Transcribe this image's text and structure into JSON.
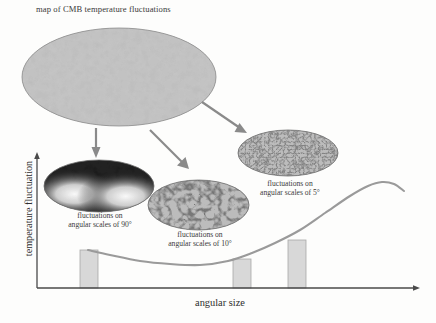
{
  "figure": {
    "title": "map of CMB temperature fluctuations",
    "background_color": "#fdfdfc"
  },
  "axes": {
    "y_label": "temperature fluctuation",
    "x_label": "angular size",
    "axis_color": "#4a4a4a",
    "origin": {
      "x": 37,
      "y": 288
    },
    "x_end": 420,
    "y_top": 152
  },
  "maps": [
    {
      "id": "cmb-full-sky",
      "name": "map-cmb-full-sky",
      "caption": "",
      "pattern": "fine-grainy-noise",
      "scale_degrees": null
    },
    {
      "id": "map-90deg",
      "name": "map-90-degrees",
      "caption_line1": "fluctuations on",
      "caption_line2": "angular scales of 90°",
      "pattern": "dipole-gradient",
      "scale_degrees": "90°"
    },
    {
      "id": "map-10deg",
      "name": "map-10-degrees",
      "caption_line1": "fluctuations on",
      "caption_line2": "angular scales of 10°",
      "pattern": "medium-speckle",
      "scale_degrees": "10°"
    },
    {
      "id": "map-5deg",
      "name": "map-5-degrees",
      "caption_line1": "fluctuations on",
      "caption_line2": "angular scales of 5°",
      "pattern": "fine-speckle",
      "scale_degrees": "5°"
    }
  ],
  "arrows": [
    {
      "name": "arrow-to-90",
      "from": [
        96,
        128
      ],
      "to": [
        96,
        156
      ],
      "direction": "down"
    },
    {
      "name": "arrow-to-10",
      "from": [
        148,
        128
      ],
      "to": [
        188,
        168
      ],
      "direction": "down-right"
    },
    {
      "name": "arrow-to-5",
      "from": [
        200,
        100
      ],
      "to": [
        246,
        132
      ],
      "direction": "down-right"
    }
  ],
  "chart_data": {
    "type": "line",
    "title": "map of CMB temperature fluctuations",
    "xlabel": "angular size",
    "ylabel": "temperature fluctuation",
    "grid": false,
    "legend": null,
    "axis_direction_note": "angular size decreases to the right; axes drawn as arrows with no tick labels",
    "x_tick_labels": [],
    "y_tick_labels": [],
    "series": [
      {
        "name": "CMB angular power spectrum",
        "curve_color": "#9a9a9a",
        "points": [
          [
            88,
            250
          ],
          [
            110,
            255
          ],
          [
            140,
            261
          ],
          [
            170,
            264
          ],
          [
            200,
            265
          ],
          [
            228,
            261
          ],
          [
            252,
            253
          ],
          [
            275,
            243
          ],
          [
            300,
            230
          ],
          [
            325,
            213
          ],
          [
            350,
            196
          ],
          [
            368,
            186
          ],
          [
            382,
            182
          ],
          [
            394,
            184
          ],
          [
            404,
            191
          ]
        ]
      }
    ],
    "highlight_bars": [
      {
        "name": "bar-90-degrees",
        "label": "90°",
        "x_left": 80,
        "x_right": 98,
        "top_y": 250,
        "baseline_y": 288,
        "fill": "#d8d8d8",
        "stroke": "#a8a8a8"
      },
      {
        "name": "bar-10-degrees",
        "label": "10°",
        "x_left": 233,
        "x_right": 251,
        "top_y": 259,
        "baseline_y": 288,
        "fill": "#d8d8d8",
        "stroke": "#a8a8a8"
      },
      {
        "name": "bar-5-degrees",
        "label": "5°",
        "x_left": 288,
        "x_right": 306,
        "top_y": 240,
        "baseline_y": 288,
        "fill": "#d8d8d8",
        "stroke": "#a8a8a8"
      }
    ]
  }
}
